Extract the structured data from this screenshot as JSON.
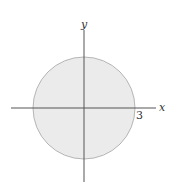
{
  "diagram": {
    "type": "shaded disk on coordinate axes",
    "axes": {
      "x_label": "x",
      "y_label": "y"
    },
    "circle": {
      "center": [
        0,
        0
      ],
      "radius": 3,
      "radius_label": "3",
      "fill": "#ebebeb",
      "stroke": "#b5b5b5"
    },
    "axis_color": "#555555"
  }
}
